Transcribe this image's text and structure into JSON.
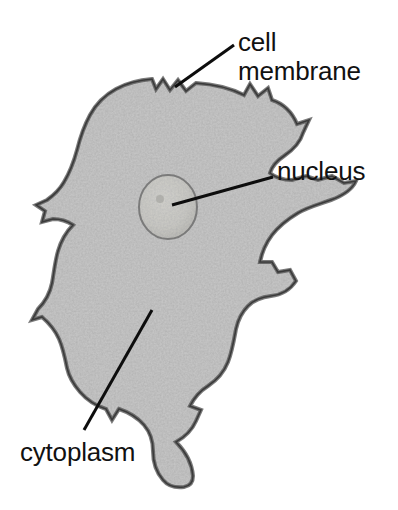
{
  "figure": {
    "background_color": "#ffffff",
    "width": 398,
    "height": 510
  },
  "labels": {
    "cell_membrane": {
      "line1": "cell",
      "line2": "membrane",
      "text": "cell membrane",
      "color": "#111111",
      "font_size_px": 26
    },
    "nucleus": {
      "text": "nucleus",
      "color": "#111111",
      "font_size_px": 26
    },
    "cytoplasm": {
      "text": "cytoplasm",
      "color": "#111111",
      "font_size_px": 26
    }
  },
  "leader_lines": [
    {
      "name": "cell-membrane-leader",
      "from": [
        234,
        45
      ],
      "to": [
        175,
        87
      ],
      "stroke": "#0d0d0d",
      "width": 3
    },
    {
      "name": "nucleus-leader",
      "from": [
        273,
        177
      ],
      "to": [
        172,
        205
      ],
      "stroke": "#0d0d0d",
      "width": 3
    },
    {
      "name": "cytoplasm-leader",
      "from": [
        84,
        430
      ],
      "to": [
        152,
        310
      ],
      "stroke": "#0d0d0d",
      "width": 3
    }
  ],
  "specimen": {
    "name": "amoeba",
    "cytoplasm_color": "#b2b2b2",
    "cytoplasm_highlight": "#d2d2d2",
    "membrane_color": "#5c5c5c",
    "nucleus_color": "#c6c6c2",
    "nucleus_rim_color": "#6e6e6e",
    "nucleus_center": [
      168,
      207
    ],
    "nucleus_radius_x": 29,
    "nucleus_radius_y": 32
  }
}
